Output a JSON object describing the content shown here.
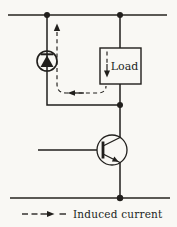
{
  "window": {
    "width": 177,
    "height": 227
  },
  "diagram": {
    "kind": "circuit-schematic",
    "load": {
      "label": "Load"
    },
    "legend": {
      "label": "Induced current"
    },
    "colors": {
      "ink": "#211f1c",
      "paper": "#f9f8f4"
    }
  }
}
